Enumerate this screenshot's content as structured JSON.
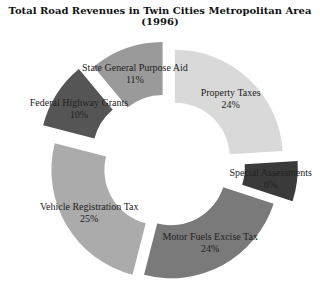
{
  "chart_data": {
    "type": "pie",
    "variant": "exploded-donut",
    "title": "Total Road Revenues in Twin Cities Metropolitan Area (1996)",
    "categories": [
      "Property Taxes",
      "Special Assessments",
      "Motor Fuels Excise Tax",
      "Vehicle Registration Tax",
      "Federal Highway Grants",
      "State General Purpose Aid"
    ],
    "values": [
      24,
      6,
      24,
      25,
      10,
      11
    ],
    "labels": [
      "24%",
      "6%",
      "24%",
      "25%",
      "10%",
      "11%"
    ],
    "colors": [
      "#d9d9d9",
      "#3a3a3a",
      "#7a7a7a",
      "#ababab",
      "#555555",
      "#9a9a9a"
    ],
    "start_angle": "12 o'clock",
    "direction": "clockwise",
    "legend": "none (labels on slices)"
  }
}
